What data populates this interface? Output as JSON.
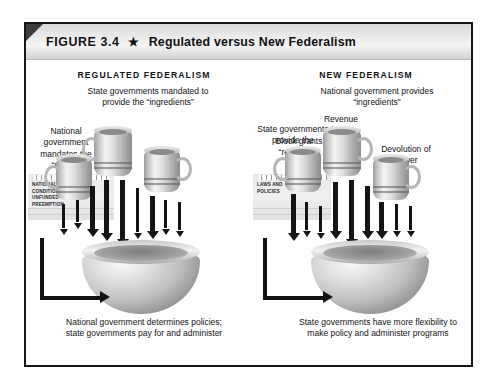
{
  "figure": {
    "number_label": "FIGURE 3.4",
    "star_icon": "star-icon",
    "title": "Regulated versus New Federalism"
  },
  "panels": {
    "left": {
      "heading": "REGULATED FEDERALISM",
      "top_caption": "State governments mandated to provide the “ingredients”",
      "side_caption": "National government mandates the “recipe”",
      "notepad_lines": [
        "NATIONAL STANDARDS",
        "CONDITIONAL GRANTS",
        "UNFUNDED MANDATES",
        "PREEMPTION"
      ],
      "bottom_caption": "National government determines policies; state governments pay for and administer",
      "mug_labels": []
    },
    "right": {
      "heading": "NEW FEDERALISM",
      "top_caption": "National government provides “ingredients”",
      "side_caption": "State governments provide the “recipe”",
      "notepad_lines": [
        "LAWS AND",
        "POLICIES"
      ],
      "bottom_caption": "State governments have more flexibility to make policy and administer programs",
      "mug_labels": [
        "Block grants",
        "Revenue sharing",
        "Devolution of power"
      ]
    }
  },
  "colors": {
    "frame_border": "#17171a",
    "title_band_light": "#f4f4f4",
    "title_band_dark": "#d2d2d2",
    "corner_fold": "#3c3c40",
    "ink": "#141417",
    "paper": "#e9e9e9",
    "page_background": "#ffffff"
  }
}
